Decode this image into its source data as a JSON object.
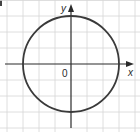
{
  "figure": {
    "part_marker": ")",
    "x_axis_label": "x",
    "y_axis_label": "y",
    "origin_label": "0",
    "grid": {
      "spacing_px": 16,
      "origin_px": [
        71,
        64
      ],
      "x_range_units": [
        -4,
        4
      ],
      "y_range_units": [
        -4,
        4
      ],
      "color": "#d6d6d6"
    },
    "axis_color": "#2a2a2a",
    "curve": {
      "type": "circle",
      "center": [
        0,
        0
      ],
      "radius": 3,
      "equation": "x^2 + y^2 = 9",
      "color": "#3a3a3a"
    }
  }
}
